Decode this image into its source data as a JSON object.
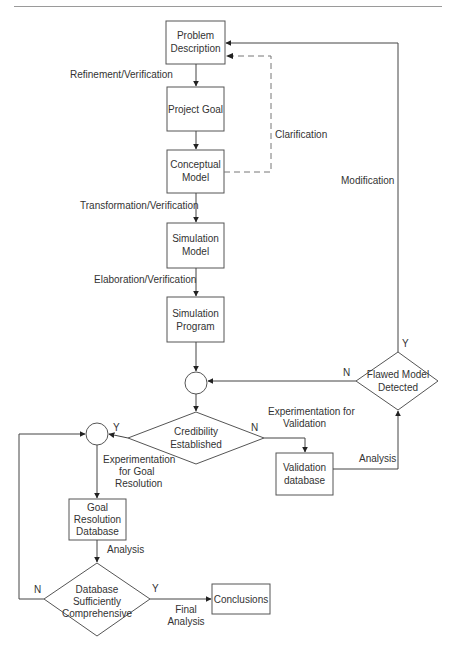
{
  "diagram": {
    "type": "flowchart",
    "nodes": {
      "problem_description": {
        "lines": [
          "Problem",
          "Description"
        ]
      },
      "project_goal": {
        "lines": [
          "Project Goal"
        ]
      },
      "conceptual_model": {
        "lines": [
          "Conceptual",
          "Model"
        ]
      },
      "simulation_model": {
        "lines": [
          "Simulation",
          "Model"
        ]
      },
      "simulation_program": {
        "lines": [
          "Simulation",
          "Program"
        ]
      },
      "credibility_established": {
        "lines": [
          "Credibility",
          "Established"
        ]
      },
      "flawed_model_detected": {
        "lines": [
          "Flawed Model",
          "Detected"
        ]
      },
      "validation_database": {
        "lines": [
          "Validation",
          "database"
        ]
      },
      "goal_resolution_database": {
        "lines": [
          "Goal",
          "Resolution",
          "Database"
        ]
      },
      "database_sufficiently_comprehensive": {
        "lines": [
          "Database",
          "Sufficiently",
          "Comprehensive"
        ]
      },
      "conclusions": {
        "lines": [
          "Conclusions"
        ]
      }
    },
    "edge_labels": {
      "refinement_verification": "Refinement/Verification",
      "clarification": "Clarification",
      "transformation_verification": "Transformation/Verification",
      "elaboration_verification": "Elaboration/Verification",
      "modification": "Modification",
      "experimentation_validation": [
        "Experimentation for",
        "Validation"
      ],
      "analysis_validation": "Analysis",
      "experimentation_goal": [
        "Experimentation",
        "for Goal",
        "Resolution"
      ],
      "analysis_goal": "Analysis",
      "final_analysis": [
        "Final",
        "Analysis"
      ],
      "flawed_yes": "Y",
      "flawed_no": "N",
      "credibility_yes": "Y",
      "credibility_no": "N",
      "database_yes": "Y",
      "database_no": "N"
    }
  }
}
